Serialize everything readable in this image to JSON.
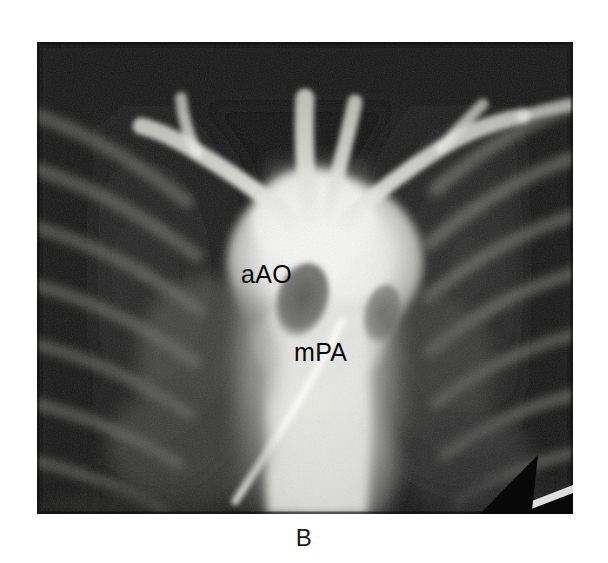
{
  "figure": {
    "panel_letter": "B",
    "modality": "angiogram",
    "frame": {
      "x": 37,
      "y": 42,
      "width": 536,
      "height": 472
    }
  },
  "annotations": {
    "labels": [
      {
        "id": "aao",
        "text": "aAO",
        "x": 204,
        "y": 220,
        "meaning": "ascending aorta"
      },
      {
        "id": "mpa",
        "text": "mPA",
        "x": 257,
        "y": 298,
        "meaning": "main pulmonary artery"
      }
    ],
    "arrow": {
      "name": "pointer-arrow",
      "from": {
        "x": 400,
        "y": 227
      },
      "to": {
        "x": 337,
        "y": 252
      },
      "color": "#080808"
    }
  },
  "palette": {
    "background": "#ffffff",
    "film_dark": "#0d0d0d",
    "film_mid": "#6b6b6b",
    "contrast_bright": "#f2f2f0",
    "label_ink": "#0a0a0a"
  }
}
